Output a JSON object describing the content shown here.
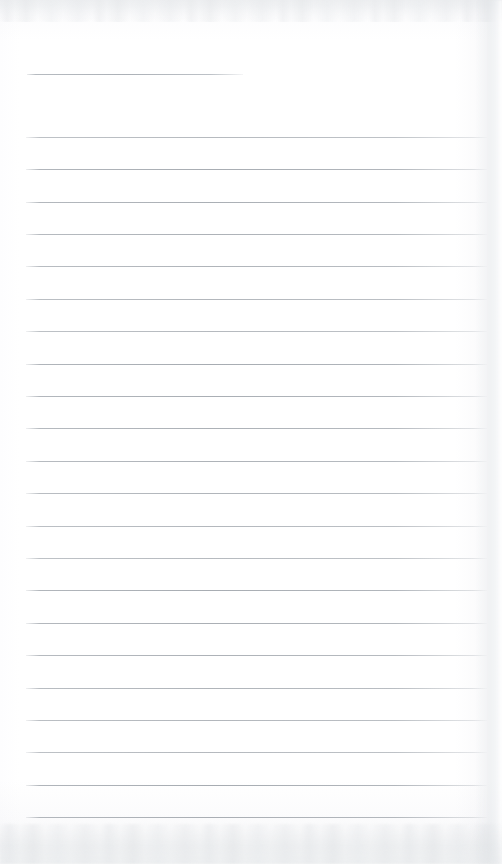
{
  "document": {
    "kind": "scanned-lined-notebook-page",
    "title": "",
    "body_text": "",
    "page_width": 502,
    "page_height": 864,
    "paper_color": "#ffffff",
    "rule_color": "#a9aeb4",
    "scan_shadow_color": "#e4e6e9"
  },
  "ruling": {
    "header_rule": {
      "label": "header-rule",
      "y": 74,
      "x_start": 27,
      "x_end": 243,
      "thickness": 1
    },
    "body_rules": {
      "label": "body-rules",
      "count": 22,
      "first_y": 137,
      "spacing": 32.4,
      "x_start": 26,
      "x_end": 487,
      "thickness": 1,
      "y_positions": [
        137,
        169,
        202,
        234,
        266,
        299,
        331,
        364,
        396,
        428,
        461,
        493,
        526,
        558,
        590,
        623,
        655,
        688,
        720,
        752,
        785,
        817
      ]
    }
  },
  "written_content": {
    "lines": [
      "",
      "",
      "",
      "",
      "",
      "",
      "",
      "",
      "",
      "",
      "",
      "",
      "",
      "",
      "",
      "",
      "",
      "",
      "",
      "",
      "",
      ""
    ],
    "note": "page is blank — no handwriting or printed text present"
  }
}
